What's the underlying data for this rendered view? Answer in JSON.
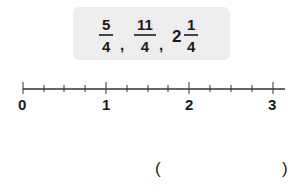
{
  "question_box": {
    "items": [
      {
        "type": "fraction",
        "numerator": "5",
        "denominator": "4"
      },
      {
        "type": "separator",
        "text": ","
      },
      {
        "type": "fraction",
        "numerator": "11",
        "denominator": "4"
      },
      {
        "type": "separator",
        "text": ","
      },
      {
        "type": "mixed",
        "whole": "2",
        "numerator": "1",
        "denominator": "4"
      }
    ]
  },
  "number_line": {
    "labels": [
      "0",
      "1",
      "2",
      "3"
    ],
    "ticks_per_unit": 4,
    "range": [
      0,
      3
    ]
  },
  "answer": {
    "open_paren": "(",
    "close_paren": ")",
    "value": ""
  }
}
